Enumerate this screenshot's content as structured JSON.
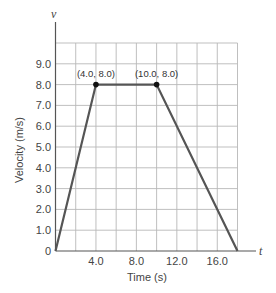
{
  "chart_data": {
    "type": "line",
    "title": "",
    "xlabel": "Time (s)",
    "ylabel": "Velocity (m/s)",
    "x_axis_symbol": "t",
    "y_axis_symbol": "v",
    "xlim": [
      0,
      18
    ],
    "ylim": [
      0,
      10
    ],
    "x_grid_step": 2,
    "y_grid_step": 1,
    "grid": true,
    "x_ticks": [
      {
        "value": 4,
        "label": "4.0"
      },
      {
        "value": 8,
        "label": "8.0"
      },
      {
        "value": 12,
        "label": "12.0"
      },
      {
        "value": 16,
        "label": "16.0"
      }
    ],
    "y_ticks": [
      {
        "value": 0,
        "label": "0"
      },
      {
        "value": 1,
        "label": "1.0"
      },
      {
        "value": 2,
        "label": "2.0"
      },
      {
        "value": 3,
        "label": "3.0"
      },
      {
        "value": 4,
        "label": "4.0"
      },
      {
        "value": 5,
        "label": "5.0"
      },
      {
        "value": 6,
        "label": "6.0"
      },
      {
        "value": 7,
        "label": "7.0"
      },
      {
        "value": 8,
        "label": "8.0"
      },
      {
        "value": 9,
        "label": "9.0"
      }
    ],
    "series": [
      {
        "name": "velocity",
        "x": [
          0,
          4,
          10,
          18
        ],
        "y": [
          0,
          8,
          8,
          0
        ]
      }
    ],
    "annotations": [
      {
        "x": 4,
        "y": 8,
        "text": "(4.0, 8.0)"
      },
      {
        "x": 10,
        "y": 8,
        "text": "(10.0, 8.0)"
      }
    ],
    "legend": null
  }
}
